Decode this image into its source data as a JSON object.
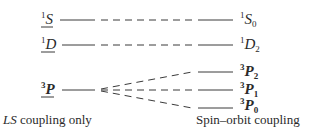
{
  "diagram": {
    "type": "energy-level-splitting",
    "left_terms": [
      {
        "sup": "1",
        "letter": "S",
        "underlined": true
      },
      {
        "sup": "1",
        "letter": "D",
        "underlined": true
      },
      {
        "sup": "3",
        "letter": "P",
        "underlined": true
      }
    ],
    "right_levels": [
      {
        "sup": "1",
        "letter": "S",
        "sub": "0"
      },
      {
        "sup": "1",
        "letter": "D",
        "sub": "2"
      },
      {
        "sup": "3",
        "letter": "P",
        "sub": "2"
      },
      {
        "sup": "3",
        "letter": "P",
        "sub": "1"
      },
      {
        "sup": "3",
        "letter": "P",
        "sub": "0"
      }
    ],
    "captions": {
      "left_italic": "LS",
      "left_rest": " coupling only",
      "right": "Spin–orbit coupling"
    },
    "connections": [
      {
        "from": "1S",
        "to": "1S0"
      },
      {
        "from": "1D",
        "to": "1D2"
      },
      {
        "from": "3P",
        "to": "3P2"
      },
      {
        "from": "3P",
        "to": "3P1"
      },
      {
        "from": "3P",
        "to": "3P0"
      }
    ],
    "line_color": "#3a3a3a"
  }
}
